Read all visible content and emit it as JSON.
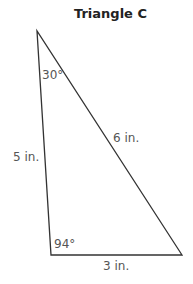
{
  "title": "Triangle C",
  "angles": {
    "top": "30°",
    "bottom_left": "94°"
  },
  "sides": {
    "left": "5 in.",
    "hypotenuse": "6 in.",
    "bottom": "3 in."
  },
  "colors": {
    "line": "#333333",
    "label": "#555555",
    "title": "#222222"
  }
}
